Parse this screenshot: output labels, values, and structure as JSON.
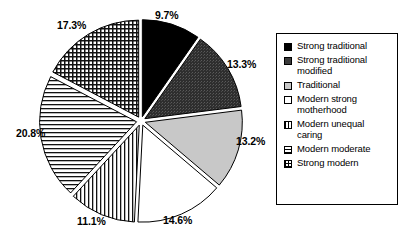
{
  "chart_data": {
    "type": "pie",
    "title": "",
    "xlabel": "",
    "ylabel": "",
    "legend_position": "right",
    "exploded": true,
    "units": "percent",
    "categories": [
      "Strong traditional",
      "Strong traditional modified",
      "Traditional",
      "Modern strong motherhood",
      "Modern unequal caring",
      "Modern moderate",
      "Strong modern"
    ],
    "values": [
      9.7,
      13.3,
      13.2,
      14.6,
      11.1,
      20.8,
      17.3
    ],
    "data_labels": [
      "9.7%",
      "13.3%",
      "13.2%",
      "14.6%",
      "11.1%",
      "20.8%",
      "17.3%"
    ],
    "slices": [
      {
        "label": "Strong traditional",
        "value": 9.7,
        "data_label": "9.7%",
        "fill": "solid-black",
        "color": "#000000",
        "label_x": 155,
        "label_y": 9
      },
      {
        "label": "Strong traditional modified",
        "value": 13.3,
        "data_label": "13.3%",
        "fill": "dark-stipple",
        "color": "#333333",
        "label_x": 227,
        "label_y": 58
      },
      {
        "label": "Traditional",
        "value": 13.2,
        "data_label": "13.2%",
        "fill": "light-gray",
        "color": "#c8c8c8",
        "label_x": 236,
        "label_y": 135
      },
      {
        "label": "Modern strong motherhood",
        "value": 14.6,
        "data_label": "14.6%",
        "fill": "white",
        "color": "#ffffff",
        "label_x": 163,
        "label_y": 214
      },
      {
        "label": "Modern unequal caring",
        "value": 11.1,
        "data_label": "11.1%",
        "fill": "vertical-lines",
        "color": "#ffffff",
        "label_x": 77,
        "label_y": 215
      },
      {
        "label": "Modern moderate",
        "value": 20.8,
        "data_label": "20.8%",
        "fill": "horizontal-lines",
        "color": "#ffffff",
        "label_x": 16,
        "label_y": 127
      },
      {
        "label": "Strong modern",
        "value": 17.3,
        "data_label": "17.3%",
        "fill": "grid",
        "color": "#ffffff",
        "label_x": 57,
        "label_y": 19
      }
    ]
  },
  "legend": {
    "items": [
      {
        "label": "Strong traditional",
        "swatch": "solid-black-swatch"
      },
      {
        "label": "Strong traditional modified",
        "swatch": "dark-stipple-swatch"
      },
      {
        "label": "Traditional",
        "swatch": "light-gray-swatch"
      },
      {
        "label": "Modern strong motherhood",
        "swatch": "white-swatch"
      },
      {
        "label": "Modern unequal caring",
        "swatch": "vertical-lines-swatch"
      },
      {
        "label": "Modern moderate",
        "swatch": "horizontal-lines-swatch"
      },
      {
        "label": "Strong modern",
        "swatch": "grid-swatch"
      }
    ]
  }
}
